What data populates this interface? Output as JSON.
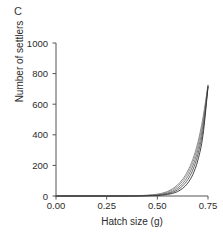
{
  "figure": {
    "panel_label": "C",
    "background_color": "#ffffff"
  },
  "axes": {
    "xlabel": "Hatch size (g)",
    "ylabel": "Number of settlers",
    "xticks": [
      "0.00",
      "0.25",
      "0.50",
      "0.75"
    ],
    "yticks": [
      "0",
      "200",
      "400",
      "600",
      "800",
      "1000"
    ],
    "axis_color": "#555555"
  },
  "chart_data": {
    "type": "line",
    "title": "",
    "subtitle": "",
    "panel": "C",
    "xlabel": "Hatch size (g)",
    "ylabel": "Number of settlers",
    "xlim": [
      0.0,
      0.75
    ],
    "ylim": [
      0,
      1000
    ],
    "xticks": [
      0.0,
      0.25,
      0.5,
      0.75
    ],
    "yticks": [
      0,
      200,
      400,
      600,
      800,
      1000
    ],
    "grid": false,
    "legend": null,
    "legend_position": "none",
    "x": [
      0.0,
      0.05,
      0.1,
      0.15,
      0.2,
      0.25,
      0.3,
      0.35,
      0.4,
      0.45,
      0.5,
      0.525,
      0.55,
      0.575,
      0.6,
      0.625,
      0.65,
      0.675,
      0.7,
      0.725,
      0.75
    ],
    "series": [
      {
        "name": "curve-1",
        "color": "#808080",
        "values": [
          0,
          0,
          0,
          0,
          0,
          0,
          0,
          1,
          2,
          5,
          12,
          19,
          30,
          47,
          73,
          110,
          163,
          240,
          350,
          510,
          725
        ]
      },
      {
        "name": "curve-2",
        "color": "#8c8c8c",
        "values": [
          0,
          0,
          0,
          0,
          0,
          0,
          0,
          1,
          2,
          4,
          10,
          16,
          25,
          40,
          63,
          97,
          147,
          220,
          328,
          488,
          722
        ]
      },
      {
        "name": "curve-3",
        "color": "#6e6e6e",
        "values": [
          0,
          0,
          0,
          0,
          0,
          0,
          0,
          0,
          1,
          3,
          7,
          12,
          19,
          31,
          51,
          81,
          127,
          196,
          300,
          460,
          718
        ]
      },
      {
        "name": "curve-4",
        "color": "#5a5a5a",
        "values": [
          0,
          0,
          0,
          0,
          0,
          0,
          0,
          0,
          1,
          2,
          5,
          9,
          15,
          24,
          40,
          66,
          106,
          170,
          270,
          430,
          715
        ]
      },
      {
        "name": "curve-5",
        "color": "#2e2e2e",
        "values": [
          0,
          0,
          0,
          0,
          0,
          0,
          0,
          0,
          0,
          1,
          3,
          6,
          10,
          17,
          29,
          50,
          84,
          140,
          234,
          395,
          712
        ]
      }
    ]
  }
}
